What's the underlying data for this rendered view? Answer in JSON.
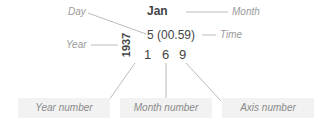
{
  "diagram": {
    "month_value": "Jan",
    "time_value": "5 (00.59)",
    "year_value": "1937",
    "digits": [
      "1",
      "6",
      "9"
    ],
    "labels": {
      "day": "Day",
      "month": "Month",
      "year": "Year",
      "time": "Time"
    },
    "boxes": [
      "Year number",
      "Month number",
      "Axis number"
    ]
  }
}
